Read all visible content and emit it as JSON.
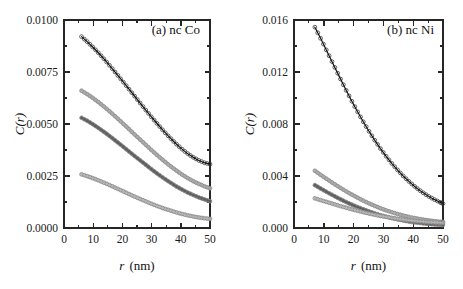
{
  "figure": {
    "background": "#ffffff",
    "panel_count": 2
  },
  "chart_data": [
    {
      "type": "scatter",
      "panel_id": "a",
      "title": "(a) nc Co",
      "xlabel": "r (nm)",
      "xlabel_italic_part": "r",
      "xlabel_unit_part": "(nm)",
      "ylabel": "C(r)",
      "xlim": [
        0,
        50
      ],
      "ylim": [
        0.0,
        0.01
      ],
      "xticks": [
        0,
        10,
        20,
        30,
        40,
        50
      ],
      "xticklabels": [
        "0",
        "10",
        "20",
        "30",
        "40",
        "50"
      ],
      "yticks": [
        0.0,
        0.0025,
        0.005,
        0.0075,
        0.01
      ],
      "yticklabels": [
        "0.0000",
        "0.0025",
        "0.0050",
        "0.0075",
        "0.0100"
      ],
      "x_minor_interval": 5,
      "y_minor_interval": 0.00125,
      "grid": false,
      "legend": "none",
      "ticks_direction": "in",
      "frame": "box",
      "x": [
        6,
        8,
        10,
        12,
        14,
        16,
        18,
        20,
        22,
        24,
        26,
        28,
        30,
        32,
        34,
        36,
        38,
        40,
        42,
        44,
        46,
        48,
        50
      ],
      "series": [
        {
          "name": "curve-1",
          "color": "#141414",
          "marker": "open-circle",
          "values": [
            0.0092,
            0.00895,
            0.00868,
            0.00839,
            0.00808,
            0.00775,
            0.00741,
            0.00707,
            0.00672,
            0.00637,
            0.00602,
            0.00567,
            0.00533,
            0.005,
            0.00468,
            0.00438,
            0.0041,
            0.00384,
            0.00361,
            0.00342,
            0.00326,
            0.00314,
            0.00307
          ]
        },
        {
          "name": "curve-2",
          "color": "#a9a9a9",
          "marker": "open-circle",
          "values": [
            0.0066,
            0.00643,
            0.00624,
            0.00603,
            0.0058,
            0.00556,
            0.00531,
            0.00505,
            0.00479,
            0.00452,
            0.00426,
            0.004,
            0.00374,
            0.00349,
            0.00325,
            0.00302,
            0.00281,
            0.00261,
            0.00243,
            0.00227,
            0.00213,
            0.00201,
            0.00191
          ]
        },
        {
          "name": "curve-3",
          "color": "#5c5c5c",
          "marker": "open-circle",
          "values": [
            0.0053,
            0.00515,
            0.00498,
            0.00479,
            0.00459,
            0.00438,
            0.00416,
            0.00394,
            0.00371,
            0.00348,
            0.00326,
            0.00304,
            0.00282,
            0.00261,
            0.00241,
            0.00222,
            0.00204,
            0.00188,
            0.00173,
            0.0016,
            0.00148,
            0.00138,
            0.00129
          ]
        },
        {
          "name": "curve-4",
          "color": "#b4b4b4",
          "marker": "open-circle",
          "values": [
            0.00258,
            0.00249,
            0.00239,
            0.00228,
            0.00216,
            0.00204,
            0.00191,
            0.00178,
            0.00165,
            0.00152,
            0.0014,
            0.00128,
            0.00116,
            0.00105,
            0.00095,
            0.00086,
            0.00077,
            0.00069,
            0.00062,
            0.00056,
            0.00051,
            0.00047,
            0.00044
          ]
        }
      ]
    },
    {
      "type": "scatter",
      "panel_id": "b",
      "title": "(b) nc Ni",
      "xlabel": "r (nm)",
      "xlabel_italic_part": "r",
      "xlabel_unit_part": "(nm)",
      "ylabel": "C(r)",
      "xlim": [
        0,
        50
      ],
      "ylim": [
        0.0,
        0.016
      ],
      "xticks": [
        0,
        10,
        20,
        30,
        40,
        50
      ],
      "xticklabels": [
        "0",
        "10",
        "20",
        "30",
        "40",
        "50"
      ],
      "yticks": [
        0.0,
        0.004,
        0.008,
        0.012,
        0.016
      ],
      "yticklabels": [
        "0.000",
        "0.004",
        "0.008",
        "0.012",
        "0.016"
      ],
      "x_minor_interval": 5,
      "y_minor_interval": 0.002,
      "grid": false,
      "legend": "none",
      "ticks_direction": "in",
      "frame": "box",
      "x": [
        7,
        9,
        11,
        13,
        15,
        17,
        19,
        21,
        23,
        25,
        27,
        29,
        31,
        33,
        35,
        37,
        39,
        41,
        43,
        45,
        47,
        49,
        50
      ],
      "series": [
        {
          "name": "curve-1",
          "color": "#141414",
          "marker": "open-circle",
          "values": [
            0.01545,
            0.01455,
            0.01362,
            0.01268,
            0.01174,
            0.01082,
            0.00993,
            0.00908,
            0.00827,
            0.0075,
            0.00678,
            0.00611,
            0.00549,
            0.00492,
            0.0044,
            0.00392,
            0.00349,
            0.0031,
            0.00276,
            0.00246,
            0.0022,
            0.00198,
            0.00188
          ]
        },
        {
          "name": "curve-2",
          "color": "#a9a9a9",
          "marker": "open-circle",
          "values": [
            0.0044,
            0.00408,
            0.00377,
            0.00346,
            0.00317,
            0.00289,
            0.00262,
            0.00237,
            0.00213,
            0.00191,
            0.00171,
            0.00152,
            0.00135,
            0.0012,
            0.00106,
            0.00094,
            0.00083,
            0.00074,
            0.00066,
            0.00059,
            0.00053,
            0.00048,
            0.00046
          ]
        },
        {
          "name": "curve-3",
          "color": "#5c5c5c",
          "marker": "open-circle",
          "values": [
            0.0033,
            0.00303,
            0.00277,
            0.00252,
            0.00228,
            0.00205,
            0.00184,
            0.00164,
            0.00146,
            0.00129,
            0.00113,
            0.00099,
            0.00086,
            0.00075,
            0.00065,
            0.00056,
            0.00048,
            0.00042,
            0.00036,
            0.00032,
            0.00028,
            0.00025,
            0.00024
          ]
        },
        {
          "name": "curve-4",
          "color": "#b4b4b4",
          "marker": "open-circle",
          "values": [
            0.00228,
            0.00214,
            0.002,
            0.00186,
            0.00172,
            0.00159,
            0.00146,
            0.00134,
            0.00123,
            0.00112,
            0.00102,
            0.00093,
            0.00085,
            0.00077,
            0.0007,
            0.00064,
            0.00059,
            0.00054,
            0.0005,
            0.00046,
            0.00043,
            0.00041,
            0.0004
          ]
        }
      ]
    }
  ]
}
